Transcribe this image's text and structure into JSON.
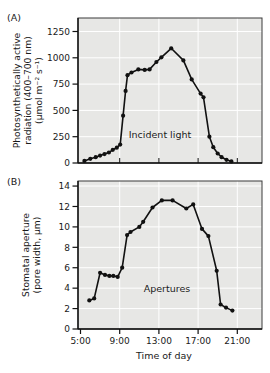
{
  "figure": {
    "panel_a_label": "(A)",
    "panel_b_label": "(B)",
    "xlabel": "Time of day"
  },
  "colors": {
    "figure_bg": "#ffffff",
    "plot_bg": "#e7e7e5",
    "grid": "#ffffff",
    "frame": "#3a3a3a",
    "axis": "#111111",
    "series": "#111111",
    "text": "#1a1a1a"
  },
  "chart_data": [
    {
      "panel": "A",
      "type": "line",
      "annotation": "Incident light",
      "ylabel_lines": [
        "Photosynthetically active",
        "radiation (400–700 nm)",
        "(μmol m⁻² s⁻¹)"
      ],
      "y_unit": "μmol m⁻² s⁻¹",
      "x_unit": "time of day (decimal hours)",
      "xlim": [
        5,
        23.5
      ],
      "ylim": [
        0,
        1375
      ],
      "grid": true,
      "y_ticks": [
        0,
        250,
        500,
        750,
        1000,
        1250
      ],
      "y_tick_labels": [
        "0",
        "250",
        "500",
        "750",
        "1000",
        "1250"
      ],
      "x_ticks": [
        5,
        9,
        13,
        17,
        21
      ],
      "x_tick_labels": [
        "5:00",
        "9:00",
        "13:00",
        "17:00",
        "21:00"
      ],
      "points": [
        [
          5.4,
          20
        ],
        [
          6.0,
          40
        ],
        [
          6.55,
          55
        ],
        [
          7.0,
          70
        ],
        [
          7.45,
          85
        ],
        [
          7.9,
          100
        ],
        [
          8.3,
          125
        ],
        [
          8.7,
          145
        ],
        [
          9.05,
          175
        ],
        [
          9.35,
          450
        ],
        [
          9.6,
          685
        ],
        [
          9.8,
          835
        ],
        [
          10.2,
          860
        ],
        [
          10.9,
          890
        ],
        [
          11.55,
          885
        ],
        [
          12.05,
          890
        ],
        [
          12.75,
          960
        ],
        [
          13.25,
          1005
        ],
        [
          14.25,
          1090
        ],
        [
          15.5,
          975
        ],
        [
          16.35,
          795
        ],
        [
          17.25,
          660
        ],
        [
          17.55,
          625
        ],
        [
          18.15,
          250
        ],
        [
          18.55,
          150
        ],
        [
          19.0,
          90
        ],
        [
          19.4,
          55
        ],
        [
          19.9,
          30
        ],
        [
          20.4,
          15
        ]
      ]
    },
    {
      "panel": "B",
      "type": "line",
      "annotation": "Apertures",
      "ylabel_lines": [
        "Stomatal aperture",
        "(pore width, μm)"
      ],
      "y_unit": "μm",
      "x_unit": "time of day (decimal hours)",
      "xlim": [
        5,
        23.5
      ],
      "ylim": [
        0,
        14.5
      ],
      "grid": true,
      "y_ticks": [
        0,
        2,
        4,
        6,
        8,
        10,
        12,
        14
      ],
      "y_tick_labels": [
        "0",
        "2",
        "4",
        "6",
        "8",
        "10",
        "12",
        "14"
      ],
      "x_ticks": [
        5,
        9,
        13,
        17,
        21
      ],
      "x_tick_labels": [
        "5:00",
        "9:00",
        "13:00",
        "17:00",
        "21:00"
      ],
      "points": [
        [
          5.9,
          2.8
        ],
        [
          6.4,
          3.0
        ],
        [
          7.0,
          5.5
        ],
        [
          7.5,
          5.3
        ],
        [
          7.95,
          5.2
        ],
        [
          8.35,
          5.2
        ],
        [
          8.8,
          5.1
        ],
        [
          9.25,
          6.0
        ],
        [
          9.75,
          9.2
        ],
        [
          10.1,
          9.5
        ],
        [
          11.0,
          10.0
        ],
        [
          11.4,
          10.5
        ],
        [
          12.35,
          11.9
        ],
        [
          13.3,
          12.6
        ],
        [
          14.4,
          12.6
        ],
        [
          15.8,
          11.8
        ],
        [
          16.5,
          12.2
        ],
        [
          17.4,
          9.8
        ],
        [
          18.05,
          9.1
        ],
        [
          18.9,
          5.7
        ],
        [
          19.3,
          2.4
        ],
        [
          19.85,
          2.1
        ],
        [
          20.5,
          1.8
        ]
      ]
    }
  ]
}
